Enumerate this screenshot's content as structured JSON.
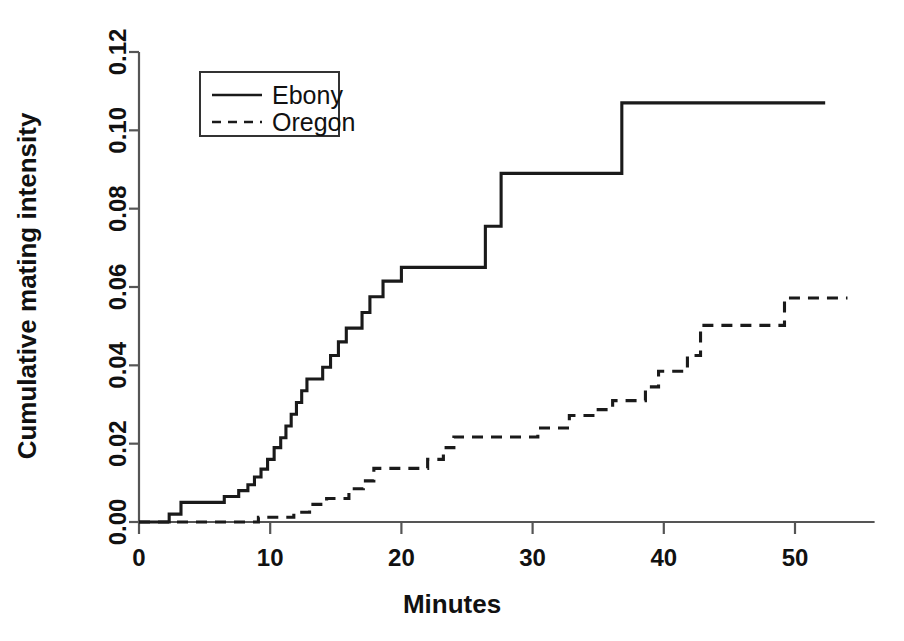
{
  "chart_data": {
    "type": "line",
    "subtype": "step",
    "title": "",
    "xlabel": "Minutes",
    "ylabel": "Cumulative mating intensity",
    "xlim": [
      0,
      55
    ],
    "ylim": [
      0.0,
      0.12
    ],
    "xticks": [
      0,
      10,
      20,
      30,
      40,
      50
    ],
    "xtick_labels": [
      "0",
      "10",
      "20",
      "30",
      "40",
      "50"
    ],
    "yticks": [
      0.0,
      0.02,
      0.04,
      0.06,
      0.08,
      0.1,
      0.12
    ],
    "ytick_labels": [
      "0.00",
      "0.02",
      "0.04",
      "0.06",
      "0.08",
      "0.10",
      "0.12"
    ],
    "grid": false,
    "legend_position": "top-left",
    "legend_entries": [
      {
        "label": "Ebony",
        "style": "solid"
      },
      {
        "label": "Oregon",
        "style": "dashed"
      }
    ],
    "series": [
      {
        "name": "Ebony",
        "style": "solid",
        "color": "#1a1a1a",
        "points": [
          [
            0.0,
            0.0
          ],
          [
            2.3,
            0.0
          ],
          [
            2.3,
            0.002
          ],
          [
            3.2,
            0.002
          ],
          [
            3.2,
            0.005
          ],
          [
            6.5,
            0.005
          ],
          [
            6.5,
            0.0065
          ],
          [
            7.6,
            0.0065
          ],
          [
            7.6,
            0.008
          ],
          [
            8.3,
            0.008
          ],
          [
            8.3,
            0.0095
          ],
          [
            8.8,
            0.0095
          ],
          [
            8.8,
            0.0115
          ],
          [
            9.3,
            0.0115
          ],
          [
            9.3,
            0.0135
          ],
          [
            9.8,
            0.0135
          ],
          [
            9.8,
            0.016
          ],
          [
            10.3,
            0.016
          ],
          [
            10.3,
            0.019
          ],
          [
            10.8,
            0.019
          ],
          [
            10.8,
            0.0215
          ],
          [
            11.2,
            0.0215
          ],
          [
            11.2,
            0.0245
          ],
          [
            11.6,
            0.0245
          ],
          [
            11.6,
            0.0275
          ],
          [
            12.0,
            0.0275
          ],
          [
            12.0,
            0.0305
          ],
          [
            12.4,
            0.0305
          ],
          [
            12.4,
            0.0335
          ],
          [
            12.8,
            0.0335
          ],
          [
            12.8,
            0.0365
          ],
          [
            14.0,
            0.0365
          ],
          [
            14.0,
            0.0395
          ],
          [
            14.6,
            0.0395
          ],
          [
            14.6,
            0.0425
          ],
          [
            15.2,
            0.0425
          ],
          [
            15.2,
            0.046
          ],
          [
            15.8,
            0.046
          ],
          [
            15.8,
            0.0495
          ],
          [
            17.0,
            0.0495
          ],
          [
            17.0,
            0.0535
          ],
          [
            17.6,
            0.0535
          ],
          [
            17.6,
            0.0575
          ],
          [
            18.6,
            0.0575
          ],
          [
            18.6,
            0.0615
          ],
          [
            20.0,
            0.0615
          ],
          [
            20.0,
            0.065
          ],
          [
            26.4,
            0.065
          ],
          [
            26.4,
            0.0755
          ],
          [
            27.6,
            0.0755
          ],
          [
            27.6,
            0.089
          ],
          [
            36.8,
            0.089
          ],
          [
            36.8,
            0.107
          ],
          [
            52.3,
            0.107
          ]
        ]
      },
      {
        "name": "Oregon",
        "style": "dashed",
        "color": "#1a1a1a",
        "points": [
          [
            0.0,
            0.0
          ],
          [
            9.1,
            0.0
          ],
          [
            9.1,
            0.0012
          ],
          [
            11.8,
            0.0012
          ],
          [
            11.8,
            0.0025
          ],
          [
            13.0,
            0.0025
          ],
          [
            13.0,
            0.0045
          ],
          [
            14.3,
            0.0045
          ],
          [
            14.3,
            0.006
          ],
          [
            16.0,
            0.006
          ],
          [
            16.0,
            0.0085
          ],
          [
            17.1,
            0.0085
          ],
          [
            17.1,
            0.0105
          ],
          [
            17.9,
            0.0105
          ],
          [
            17.9,
            0.0137
          ],
          [
            22.0,
            0.0137
          ],
          [
            22.0,
            0.016
          ],
          [
            23.2,
            0.016
          ],
          [
            23.2,
            0.019
          ],
          [
            24.0,
            0.019
          ],
          [
            24.0,
            0.0217
          ],
          [
            30.4,
            0.0217
          ],
          [
            30.4,
            0.024
          ],
          [
            32.8,
            0.024
          ],
          [
            32.8,
            0.0272
          ],
          [
            35.0,
            0.0272
          ],
          [
            35.0,
            0.0287
          ],
          [
            36.1,
            0.0287
          ],
          [
            36.1,
            0.031
          ],
          [
            38.6,
            0.031
          ],
          [
            38.6,
            0.0345
          ],
          [
            39.6,
            0.0345
          ],
          [
            39.6,
            0.0385
          ],
          [
            41.8,
            0.0385
          ],
          [
            41.8,
            0.0425
          ],
          [
            42.8,
            0.0425
          ],
          [
            42.8,
            0.0502
          ],
          [
            49.2,
            0.0502
          ],
          [
            49.2,
            0.0572
          ],
          [
            54.0,
            0.0572
          ]
        ]
      }
    ]
  },
  "axes": {
    "x_title": "Minutes",
    "y_title": "Cumulative mating intensity"
  }
}
